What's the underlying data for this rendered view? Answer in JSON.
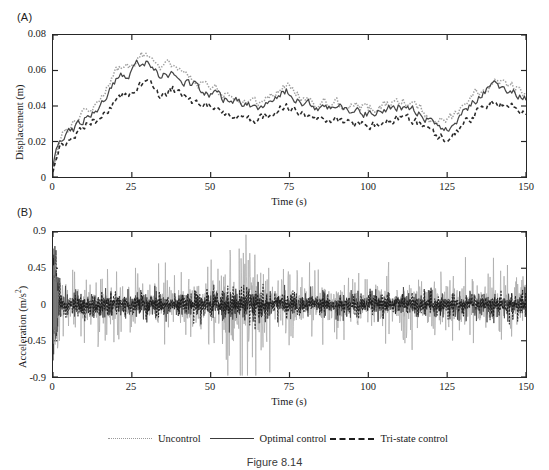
{
  "figure": {
    "caption": "Figure 8.14",
    "panels": [
      {
        "letter": "(A)",
        "name": "displacement-panel"
      },
      {
        "letter": "(B)",
        "name": "acceleration-panel"
      }
    ]
  },
  "legend": {
    "position": "bottom-center",
    "entries": [
      {
        "label": "Uncontrol",
        "style": "dotted",
        "color": "#9a9a9a"
      },
      {
        "label": "Optimal control",
        "style": "solid",
        "color": "#3c3c3c"
      },
      {
        "label": "Tri-state control",
        "style": "dashed",
        "color": "#1e1e1e"
      }
    ]
  },
  "chart_data": [
    {
      "type": "line",
      "name": "displacement-time-history",
      "panel": "(A)",
      "title": "",
      "xlabel": "Time (s)",
      "ylabel": "Displacement (m)",
      "xlim": [
        0,
        150
      ],
      "ylim": [
        0,
        0.08
      ],
      "xticks": [
        0,
        25,
        50,
        75,
        100,
        125,
        150
      ],
      "xticklabels": [
        "0",
        "25",
        "50",
        "75",
        "100",
        "125",
        "150"
      ],
      "yticks": [
        0,
        0.02,
        0.04,
        0.06,
        0.08
      ],
      "yticklabels": [
        "0",
        "0.02",
        "0.04",
        "0.06",
        "0.08"
      ],
      "grid": false,
      "legend": "bottom",
      "sampling_interval_s": 0.5,
      "series": [
        {
          "name": "Uncontrol",
          "style": "dotted",
          "color": "#9a9a9a",
          "envelope_x": [
            0,
            2,
            5,
            10,
            15,
            18,
            21,
            24,
            27,
            30,
            34,
            38,
            41,
            45,
            50,
            55,
            60,
            65,
            70,
            74,
            78,
            82,
            86,
            90,
            95,
            100,
            105,
            110,
            115,
            120,
            124,
            128,
            132,
            136,
            140,
            144,
            147,
            150
          ],
          "envelope_y": [
            0.005,
            0.022,
            0.026,
            0.035,
            0.042,
            0.052,
            0.062,
            0.06,
            0.068,
            0.07,
            0.058,
            0.064,
            0.057,
            0.054,
            0.05,
            0.046,
            0.044,
            0.042,
            0.047,
            0.052,
            0.045,
            0.043,
            0.041,
            0.042,
            0.04,
            0.038,
            0.04,
            0.043,
            0.041,
            0.034,
            0.03,
            0.035,
            0.042,
            0.05,
            0.054,
            0.052,
            0.05,
            0.047
          ],
          "ripple_amp": 0.0055
        },
        {
          "name": "Optimal control",
          "style": "solid",
          "color": "#3c3c3c",
          "envelope_x": [
            0,
            2,
            5,
            10,
            15,
            18,
            21,
            24,
            27,
            30,
            34,
            38,
            41,
            45,
            50,
            55,
            60,
            65,
            70,
            74,
            78,
            82,
            86,
            90,
            95,
            100,
            105,
            110,
            115,
            120,
            124,
            128,
            132,
            136,
            140,
            144,
            147,
            150
          ],
          "envelope_y": [
            0.004,
            0.02,
            0.024,
            0.033,
            0.04,
            0.049,
            0.058,
            0.056,
            0.064,
            0.066,
            0.055,
            0.06,
            0.054,
            0.051,
            0.047,
            0.043,
            0.041,
            0.039,
            0.044,
            0.049,
            0.042,
            0.04,
            0.038,
            0.039,
            0.037,
            0.035,
            0.037,
            0.04,
            0.038,
            0.031,
            0.027,
            0.032,
            0.039,
            0.047,
            0.051,
            0.049,
            0.047,
            0.044
          ],
          "ripple_amp": 0.0048
        },
        {
          "name": "Tri-state control",
          "style": "dashed",
          "color": "#1e1e1e",
          "envelope_x": [
            0,
            2,
            5,
            10,
            15,
            18,
            21,
            24,
            27,
            30,
            34,
            38,
            41,
            45,
            50,
            55,
            60,
            65,
            70,
            74,
            78,
            82,
            86,
            90,
            95,
            100,
            105,
            110,
            115,
            120,
            124,
            128,
            132,
            136,
            140,
            144,
            147,
            150
          ],
          "envelope_y": [
            0.003,
            0.016,
            0.02,
            0.029,
            0.033,
            0.04,
            0.047,
            0.045,
            0.052,
            0.054,
            0.045,
            0.05,
            0.045,
            0.042,
            0.039,
            0.035,
            0.034,
            0.032,
            0.037,
            0.041,
            0.035,
            0.033,
            0.031,
            0.032,
            0.03,
            0.029,
            0.031,
            0.033,
            0.031,
            0.025,
            0.022,
            0.026,
            0.032,
            0.039,
            0.043,
            0.041,
            0.039,
            0.037
          ],
          "ripple_amp": 0.0046
        }
      ]
    },
    {
      "type": "line",
      "name": "acceleration-time-history",
      "panel": "(B)",
      "title": "",
      "xlabel": "Time (s)",
      "ylabel": "Acceleration (m/s2)",
      "xlim": [
        0,
        150
      ],
      "ylim": [
        -0.9,
        0.9
      ],
      "xticks": [
        0,
        25,
        50,
        75,
        100,
        125,
        150
      ],
      "xticklabels": [
        "0",
        "25",
        "50",
        "75",
        "100",
        "125",
        "150"
      ],
      "yticks": [
        -0.9,
        -0.45,
        0,
        0.45,
        0.9
      ],
      "yticklabels": [
        "-0.9",
        "-0.45",
        "0",
        "0.45",
        "0.9"
      ],
      "grid": false,
      "legend": "bottom",
      "sampling_interval_s": 0.12,
      "series": [
        {
          "name": "Uncontrol",
          "style": "dotted",
          "color": "#a8a8a8",
          "envelope_x": [
            0,
            1,
            3,
            6,
            10,
            14,
            18,
            22,
            26,
            30,
            34,
            38,
            42,
            46,
            50,
            54,
            57,
            60,
            63,
            66,
            70,
            74,
            78,
            82,
            86,
            90,
            95,
            100,
            105,
            110,
            115,
            120,
            125,
            130,
            135,
            140,
            145,
            150
          ],
          "envelope_y": [
            0.55,
            0.52,
            0.3,
            0.26,
            0.33,
            0.3,
            0.36,
            0.3,
            0.34,
            0.28,
            0.3,
            0.26,
            0.3,
            0.38,
            0.33,
            0.72,
            0.78,
            0.68,
            0.8,
            0.6,
            0.34,
            0.3,
            0.33,
            0.28,
            0.3,
            0.26,
            0.3,
            0.28,
            0.31,
            0.27,
            0.3,
            0.32,
            0.28,
            0.3,
            0.26,
            0.3,
            0.36,
            0.33
          ],
          "ripple_amp": 1.0
        },
        {
          "name": "Optimal control",
          "style": "solid",
          "color": "#4a4a4a",
          "envelope_x": [
            0,
            1,
            3,
            6,
            10,
            14,
            18,
            22,
            26,
            30,
            34,
            38,
            42,
            46,
            50,
            54,
            57,
            60,
            63,
            66,
            70,
            74,
            78,
            82,
            86,
            90,
            95,
            100,
            105,
            110,
            115,
            120,
            125,
            130,
            135,
            140,
            145,
            150
          ],
          "envelope_y": [
            0.5,
            0.45,
            0.14,
            0.11,
            0.13,
            0.12,
            0.14,
            0.12,
            0.13,
            0.11,
            0.12,
            0.1,
            0.12,
            0.15,
            0.13,
            0.18,
            0.2,
            0.17,
            0.2,
            0.16,
            0.13,
            0.12,
            0.13,
            0.11,
            0.12,
            0.1,
            0.12,
            0.11,
            0.12,
            0.11,
            0.12,
            0.13,
            0.11,
            0.12,
            0.1,
            0.12,
            0.14,
            0.13
          ],
          "ripple_amp": 1.0
        },
        {
          "name": "Tri-state control",
          "style": "dashed",
          "color": "#1a1a1a",
          "envelope_x": [
            0,
            1,
            3,
            6,
            10,
            14,
            18,
            22,
            26,
            30,
            34,
            38,
            42,
            46,
            50,
            54,
            57,
            60,
            63,
            66,
            70,
            74,
            78,
            82,
            86,
            90,
            95,
            100,
            105,
            110,
            115,
            120,
            125,
            130,
            135,
            140,
            145,
            150
          ],
          "envelope_y": [
            0.48,
            0.44,
            0.12,
            0.1,
            0.12,
            0.11,
            0.13,
            0.11,
            0.12,
            0.1,
            0.11,
            0.09,
            0.11,
            0.14,
            0.12,
            0.16,
            0.18,
            0.15,
            0.18,
            0.14,
            0.12,
            0.11,
            0.12,
            0.1,
            0.11,
            0.09,
            0.11,
            0.1,
            0.11,
            0.1,
            0.11,
            0.12,
            0.1,
            0.11,
            0.09,
            0.11,
            0.13,
            0.12
          ],
          "ripple_amp": 1.0
        }
      ]
    }
  ]
}
